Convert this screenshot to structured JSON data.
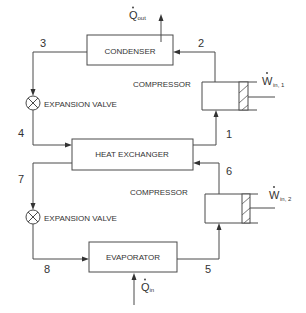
{
  "components": {
    "condenser": {
      "label": "CONDENSER"
    },
    "heat_exchanger": {
      "label": "HEAT EXCHANGER"
    },
    "evaporator": {
      "label": "EVAPORATOR"
    },
    "compressor_1": {
      "label": "COMPRESSOR",
      "work_symbol": "W",
      "work_subscript": "in, 1"
    },
    "compressor_2": {
      "label": "COMPRESSOR",
      "work_symbol": "W",
      "work_subscript": "in, 2"
    },
    "expansion_valve_1": {
      "label": "EXPANSION VALVE"
    },
    "expansion_valve_2": {
      "label": "EXPANSION VALVE"
    }
  },
  "heat_flows": {
    "out": {
      "symbol": "Q",
      "subscript": "out"
    },
    "in": {
      "symbol": "Q",
      "subscript": "in"
    }
  },
  "states": [
    "1",
    "2",
    "3",
    "4",
    "5",
    "6",
    "7",
    "8"
  ],
  "colors": {
    "stroke": "#4a4a4a",
    "text": "#333333",
    "background": "#ffffff"
  }
}
